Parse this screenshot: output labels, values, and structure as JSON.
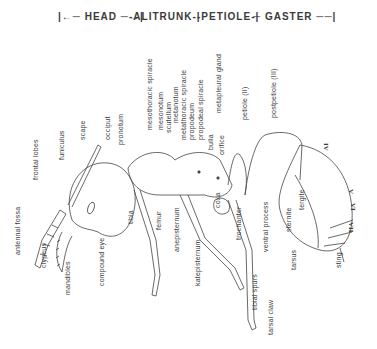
{
  "diagram": {
    "regions": [
      {
        "id": "head",
        "label": "HEAD"
      },
      {
        "id": "alitrunk",
        "label": "ALITRUNK"
      },
      {
        "id": "petiole",
        "label": "PETIOLE"
      },
      {
        "id": "gaster",
        "label": "GASTER"
      }
    ],
    "labels": {
      "antennal_fossa": "antennal fossa",
      "frontal_lobes": "frontal lobes",
      "funiculus": "funiculus",
      "scape": "scape",
      "occiput": "occiput",
      "pronotum": "pronotum",
      "clypeus": "clypeus",
      "mandibles": "mandibles",
      "compound_eye": "compound eye",
      "tibia": "tibia",
      "femur": "femur",
      "anepisternum": "anepisternum",
      "katepisternum": "katepisternum",
      "mesothoracic_spiracle": "mesothoracic spiracle",
      "mesonotum": "mesonotum",
      "scutellum": "scutellum",
      "metanotum": "metanotum",
      "metathoracic_spiracle": "metathoracic spiracle",
      "propodeum": "propodeum",
      "propodeal_spiracle": "propodeal spiracle",
      "metapleural_gland": "metapleural gland",
      "bulla": "bulla",
      "orifice": "orifice",
      "coxa": "coxa",
      "trochanter": "trochanter",
      "tibial_spurs": "tibial spurs",
      "tarsal_claw": "tarsal claw",
      "petiole_i": "petiole (II)",
      "postpetiole_iii": "postpetiole (III)",
      "ventral_process": "ventral process",
      "tarsus": "tarsus",
      "tergite": "tergite",
      "sternite": "sternite",
      "sting": "sting",
      "seg_iv": "IV",
      "seg_v": "V",
      "seg_vi": "VI",
      "seg_vii": "VII"
    }
  }
}
